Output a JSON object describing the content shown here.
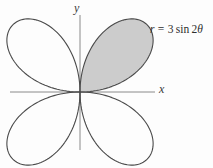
{
  "figure": {
    "width": 213,
    "height": 168,
    "background_color": "#fdfdfd"
  },
  "axes": {
    "x_label": "x",
    "y_label": "y",
    "origin": {
      "x": 80,
      "y": 92
    },
    "x_axis": {
      "x_start": 10,
      "x_end": 155,
      "y": 92
    },
    "y_axis": {
      "y_start": 15,
      "y_end": 150,
      "x": 80
    },
    "axis_color": "#8a8a8a",
    "label_color": "#3a3a3a"
  },
  "annotation": {
    "equation_r": "r",
    "equation_equals": "=",
    "equation_coefficient": "3",
    "equation_function": "sin",
    "equation_argument_multiplier": "2",
    "equation_argument_symbol": "θ",
    "equation_full": "r = 3 sin 2θ",
    "x": 150,
    "y": 24,
    "color": "#2e2e2e"
  },
  "chart_data": {
    "type": "line",
    "title": "",
    "subtitle": "",
    "xlabel": "x",
    "ylabel": "y",
    "curve_name": "four-petaled rose",
    "polar_equation": "r = 3 sin 2θ",
    "amplitude": 3,
    "petal_count": 4,
    "theta_range_deg": [
      0,
      360
    ],
    "max_radius_units": 3,
    "max_radius_px": 95,
    "petals": [
      {
        "name": "petal-quadrant-1",
        "theta_center_deg": 45,
        "theta_range_deg": [
          0,
          90
        ],
        "tip_units": {
          "x": 2.12,
          "y": 2.12
        },
        "tip_px": {
          "x": 147,
          "y": 25
        },
        "shaded": true,
        "fill_color": "#cccccc",
        "stroke_color": "#4a4a4a"
      },
      {
        "name": "petal-quadrant-2",
        "theta_center_deg": 135,
        "theta_range_deg": [
          90,
          180
        ],
        "tip_units": {
          "x": -2.12,
          "y": 2.12
        },
        "tip_px": {
          "x": 13,
          "y": 25
        },
        "shaded": false,
        "fill_color": "none",
        "stroke_color": "#4a4a4a"
      },
      {
        "name": "petal-quadrant-3",
        "theta_center_deg": 225,
        "theta_range_deg": [
          180,
          270
        ],
        "tip_units": {
          "x": -2.12,
          "y": -2.12
        },
        "tip_px": {
          "x": 13,
          "y": 159
        },
        "shaded": false,
        "fill_color": "none",
        "stroke_color": "#4a4a4a"
      },
      {
        "name": "petal-quadrant-4",
        "theta_center_deg": 315,
        "theta_range_deg": [
          270,
          360
        ],
        "tip_units": {
          "x": 2.12,
          "y": -2.12
        },
        "tip_px": {
          "x": 147,
          "y": 159
        },
        "shaded": false,
        "fill_color": "none",
        "stroke_color": "#4a4a4a"
      }
    ],
    "shaded_region": {
      "description": "first-quadrant petal filled gray",
      "theta_range_deg": [
        0,
        90
      ],
      "fill_color": "#cccccc"
    },
    "grid": false,
    "legend": false,
    "xlim": [
      -2.2,
      1.7
    ],
    "ylim": [
      -1.6,
      1.8
    ]
  },
  "colors": {
    "curve_stroke": "#4a4a4a",
    "petal_fill": "#cccccc",
    "axis": "#8a8a8a",
    "text": "#2e2e2e",
    "background": "#fdfdfd"
  }
}
